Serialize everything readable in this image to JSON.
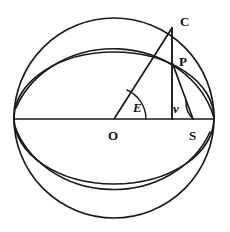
{
  "figure": {
    "background_color": "#ffffff",
    "stroke_color": "#1a1a1a"
  },
  "labels": {
    "center": "O",
    "sun": "S",
    "circle_point": "C",
    "orbit_point": "P",
    "eccentric_anomaly": "E",
    "true_anomaly": "ν"
  },
  "geometry": {
    "sphere": {
      "cx": 114,
      "cy": 118,
      "r": 100
    },
    "equator_ellipse": {
      "cx": 114,
      "cy": 118,
      "rx": 100,
      "ry": 66
    },
    "orbit_ellipse": {
      "cx": 114,
      "cy": 118,
      "rx": 100,
      "ry": 66
    },
    "axis_line": {
      "x1": 14,
      "y1": 119,
      "x2": 214,
      "y2": 119
    },
    "point_O": {
      "x": 114,
      "y": 119
    },
    "point_S": {
      "x": 193,
      "y": 119
    },
    "point_C": {
      "x": 172,
      "y": 28
    },
    "point_P": {
      "x": 172,
      "y": 62
    },
    "angle_E_degrees": 66,
    "angle_nu_degrees": 77
  },
  "label_positions": {
    "C": {
      "x": 180,
      "y": 22
    },
    "P": {
      "x": 179,
      "y": 62
    },
    "E": {
      "x": 135,
      "y": 108
    },
    "nu": {
      "x": 177,
      "y": 110
    },
    "O": {
      "x": 110,
      "y": 137
    },
    "S": {
      "x": 192,
      "y": 137
    }
  }
}
